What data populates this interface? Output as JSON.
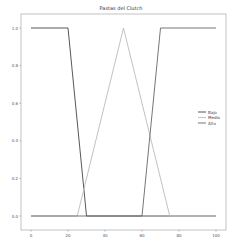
{
  "chart_data": {
    "type": "line",
    "title": "Pastas del Clutch",
    "xlabel": "",
    "ylabel": "",
    "xlim": [
      -5,
      105
    ],
    "ylim": [
      -0.05,
      1.05
    ],
    "xticks": [
      0,
      20,
      40,
      60,
      80,
      100
    ],
    "yticks": [
      0.0,
      0.2,
      0.4,
      0.6,
      0.8,
      1.0
    ],
    "xtick_labels": [
      "0",
      "20",
      "40",
      "60",
      "80",
      "100"
    ],
    "ytick_labels": [
      "0.0",
      "0.2",
      "0.4",
      "0.6",
      "0.8",
      "1.0"
    ],
    "grid": false,
    "legend_position": "center right",
    "series": [
      {
        "name": "Bajo",
        "color": "#444444",
        "x": [
          0,
          20,
          30,
          100
        ],
        "y": [
          1,
          1,
          0,
          0
        ]
      },
      {
        "name": "Medio",
        "color": "#bbbbbb",
        "x": [
          0,
          25,
          50,
          75,
          100
        ],
        "y": [
          0,
          0,
          1,
          0,
          0
        ]
      },
      {
        "name": "Alto",
        "color": "#666666",
        "x": [
          0,
          60,
          70,
          100
        ],
        "y": [
          0,
          0,
          1,
          1
        ]
      }
    ]
  }
}
